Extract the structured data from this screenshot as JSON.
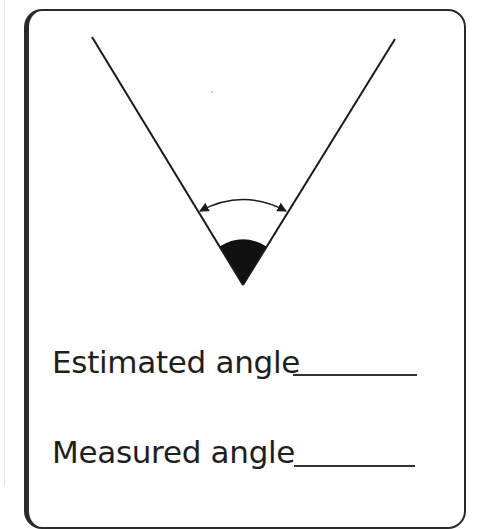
{
  "worksheet": {
    "figure": {
      "description": "Angle formed by two rays meeting at a vertex, with a shaded sector and a double-headed arc arrow marking the angle",
      "left_ray": {
        "start": [
          92,
          37
        ],
        "end": [
          243,
          285
        ]
      },
      "right_ray": {
        "start": [
          395,
          39
        ],
        "end": [
          243,
          285
        ]
      },
      "vertex": [
        243,
        285
      ],
      "arc_arrow": {
        "from": [
          200,
          211
        ],
        "to": [
          286,
          211
        ],
        "peak_y": 200
      },
      "shaded_sector_color": "#111111",
      "line_color": "#1a1a1a"
    },
    "fields": [
      {
        "label": "Estimated angle",
        "value": ""
      },
      {
        "label": "Measured angle",
        "value": ""
      }
    ]
  },
  "colors": {
    "border": "#2a2a2a",
    "text": "#1e1e1e",
    "background": "#ffffff"
  }
}
